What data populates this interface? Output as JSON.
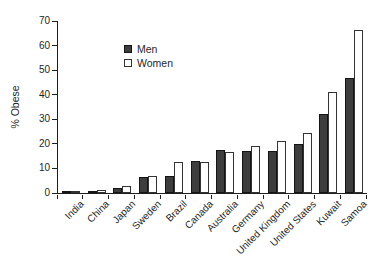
{
  "chart_data": {
    "type": "bar",
    "title": "",
    "xlabel": "",
    "ylabel": "% Obese",
    "ylim": [
      0,
      70
    ],
    "yticks": [
      0,
      10,
      20,
      30,
      40,
      50,
      60,
      70
    ],
    "grid": false,
    "legend_position": "top-left",
    "categories": [
      "India",
      "China",
      "Japan",
      "Sweden",
      "Brazil",
      "Canada",
      "Australia",
      "Germany",
      "United Kingdom",
      "United States",
      "Kuwait",
      "Samoa"
    ],
    "series": [
      {
        "name": "Men",
        "fill": "#3d3d3d",
        "border": "#141414",
        "values": [
          0.5,
          1,
          2,
          6.5,
          7,
          13,
          17.5,
          17,
          17,
          20,
          32,
          47
        ]
      },
      {
        "name": "Women",
        "fill": "#ffffff",
        "border": "#333333",
        "values": [
          0.8,
          1.2,
          3,
          7,
          12.5,
          12.5,
          16.5,
          19,
          21,
          24.5,
          41,
          66.5
        ]
      }
    ],
    "axis_color": "#1f1f1f",
    "text_color": "#1f1f1f"
  }
}
